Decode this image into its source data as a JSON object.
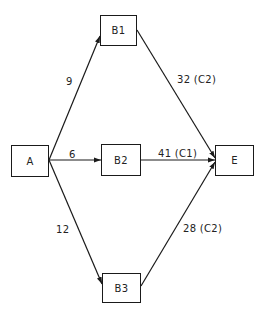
{
  "diagram": {
    "type": "network/flow graph",
    "colors": {
      "line": "#1a1a1a",
      "background": "#ffffff",
      "text": "#222222"
    },
    "nodes": [
      {
        "id": "A",
        "label": "A",
        "x": 11,
        "y": 145,
        "w": 38,
        "h": 32
      },
      {
        "id": "B1",
        "label": "B1",
        "x": 100,
        "y": 15,
        "w": 37,
        "h": 31
      },
      {
        "id": "B2",
        "label": "B2",
        "x": 101,
        "y": 144,
        "w": 40,
        "h": 32
      },
      {
        "id": "B3",
        "label": "B3",
        "x": 102,
        "y": 273,
        "w": 39,
        "h": 30
      },
      {
        "id": "E",
        "label": "E",
        "x": 215,
        "y": 145,
        "w": 39,
        "h": 31
      }
    ],
    "edges": [
      {
        "from": "A",
        "to": "B1",
        "label": "9",
        "x1": 49,
        "y1": 160,
        "x2": 100,
        "y2": 36
      },
      {
        "from": "A",
        "to": "B2",
        "label": "6",
        "x1": 49,
        "y1": 160,
        "x2": 101,
        "y2": 160
      },
      {
        "from": "A",
        "to": "B3",
        "label": "12",
        "x1": 49,
        "y1": 160,
        "x2": 102,
        "y2": 284
      },
      {
        "from": "B1",
        "to": "E",
        "label": "32 (C2)",
        "x1": 137,
        "y1": 30,
        "x2": 215,
        "y2": 158
      },
      {
        "from": "B2",
        "to": "E",
        "label": "41 (C1)",
        "x1": 141,
        "y1": 160,
        "x2": 215,
        "y2": 160
      },
      {
        "from": "B3",
        "to": "E",
        "label": "28 (C2)",
        "x1": 141,
        "y1": 286,
        "x2": 215,
        "y2": 162
      }
    ],
    "edge_labels": [
      {
        "text": "9",
        "x": 66,
        "y": 76
      },
      {
        "text": "6",
        "x": 69,
        "y": 149
      },
      {
        "text": "12",
        "x": 56,
        "y": 224
      },
      {
        "text": "32 (C2)",
        "x": 177,
        "y": 74
      },
      {
        "text": "41 (C1)",
        "x": 158,
        "y": 148
      },
      {
        "text": "28 (C2)",
        "x": 183,
        "y": 223
      }
    ]
  }
}
